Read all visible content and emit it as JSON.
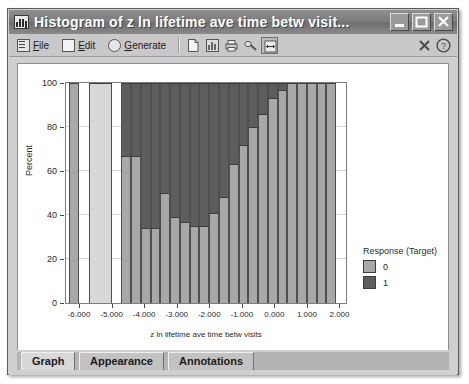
{
  "window": {
    "title": "Histogram of z ln lifetime ave time betw visit...",
    "icon": "histogram-icon",
    "buttons": {
      "minimize": "minimize-button",
      "maximize": "maximize-button",
      "close": "close-button"
    }
  },
  "toolbar": {
    "menus": [
      {
        "label": "File",
        "accel": "F",
        "icon": "file-menu-icon"
      },
      {
        "label": "Edit",
        "accel": "E",
        "icon": "edit-menu-icon"
      },
      {
        "label": "Generate",
        "accel": "G",
        "icon": "generate-menu-icon"
      }
    ],
    "tools": [
      {
        "name": "new-document-icon"
      },
      {
        "name": "export-chart-icon"
      },
      {
        "name": "print-icon"
      },
      {
        "name": "edit-properties-icon"
      },
      {
        "name": "fit-width-icon"
      }
    ],
    "right_tools": [
      {
        "name": "close-view-icon"
      },
      {
        "name": "help-icon"
      }
    ]
  },
  "tabs": [
    {
      "label": "Graph",
      "active": true
    },
    {
      "label": "Appearance",
      "active": false
    },
    {
      "label": "Annotations",
      "active": false
    }
  ],
  "legend": {
    "title": "Response (Target)",
    "entries": [
      {
        "label": "0",
        "color": "#a8a8a8"
      },
      {
        "label": "1",
        "color": "#5d5d5d"
      }
    ]
  },
  "colors": {
    "response0": "#a8a8a8",
    "response0_first": "#d8d8d8",
    "response1": "#5d5d5d",
    "plot_background": "#ffffff",
    "titlebar": "#7d7d7d",
    "window_face": "#cfcfcf"
  },
  "chart_data": {
    "type": "bar",
    "title": "Histogram of z ln lifetime ave time betw visit...",
    "subtype": "stacked-percentage-histogram",
    "xlabel": "z ln lifetime ave time betw visits",
    "ylabel": "Percent",
    "ylim": [
      0,
      100
    ],
    "yticks": [
      0,
      20,
      40,
      60,
      80,
      100
    ],
    "xlim": [
      -6.4,
      2.2
    ],
    "xticks": [
      -6.0,
      -5.0,
      -4.0,
      -3.0,
      -2.0,
      -1.0,
      0.0,
      1.0,
      2.0
    ],
    "xticklabels": [
      "-6.000",
      "-5.000",
      "-4.000",
      "-3.000",
      "-2.000",
      "-1.000",
      "0.000",
      "1.000",
      "2.000"
    ],
    "grid": true,
    "legend_position": "right",
    "bin_width": 0.3,
    "bins": [
      {
        "x0": -6.3,
        "x1": -6.0,
        "response0": 100,
        "response1": 0
      },
      {
        "x0": -5.7,
        "x1": -5.0,
        "response0": 100,
        "response1": 0
      },
      {
        "x0": -4.7,
        "x1": -4.4,
        "response0": 67,
        "response1": 33
      },
      {
        "x0": -4.4,
        "x1": -4.1,
        "response0": 67,
        "response1": 33
      },
      {
        "x0": -4.1,
        "x1": -3.8,
        "response0": 34,
        "response1": 66
      },
      {
        "x0": -3.8,
        "x1": -3.5,
        "response0": 34,
        "response1": 66
      },
      {
        "x0": -3.5,
        "x1": -3.2,
        "response0": 50,
        "response1": 50
      },
      {
        "x0": -3.2,
        "x1": -2.9,
        "response0": 39,
        "response1": 61
      },
      {
        "x0": -2.9,
        "x1": -2.6,
        "response0": 37,
        "response1": 63
      },
      {
        "x0": -2.6,
        "x1": -2.3,
        "response0": 35,
        "response1": 65
      },
      {
        "x0": -2.3,
        "x1": -2.0,
        "response0": 35,
        "response1": 65
      },
      {
        "x0": -2.0,
        "x1": -1.7,
        "response0": 41,
        "response1": 59
      },
      {
        "x0": -1.7,
        "x1": -1.4,
        "response0": 48,
        "response1": 52
      },
      {
        "x0": -1.4,
        "x1": -1.1,
        "response0": 63,
        "response1": 37
      },
      {
        "x0": -1.1,
        "x1": -0.8,
        "response0": 72,
        "response1": 28
      },
      {
        "x0": -0.8,
        "x1": -0.5,
        "response0": 80,
        "response1": 20
      },
      {
        "x0": -0.5,
        "x1": -0.2,
        "response0": 86,
        "response1": 14
      },
      {
        "x0": -0.2,
        "x1": 0.1,
        "response0": 93,
        "response1": 7
      },
      {
        "x0": 0.1,
        "x1": 0.4,
        "response0": 97,
        "response1": 3
      },
      {
        "x0": 0.4,
        "x1": 0.7,
        "response0": 100,
        "response1": 0
      },
      {
        "x0": 0.7,
        "x1": 1.0,
        "response0": 100,
        "response1": 0
      },
      {
        "x0": 1.0,
        "x1": 1.3,
        "response0": 100,
        "response1": 0
      },
      {
        "x0": 1.3,
        "x1": 1.6,
        "response0": 100,
        "response1": 0
      },
      {
        "x0": 1.6,
        "x1": 1.9,
        "response0": 100,
        "response1": 0
      }
    ]
  }
}
